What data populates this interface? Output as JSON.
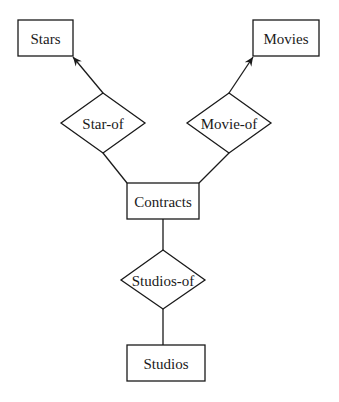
{
  "diagram": {
    "type": "entity-relationship",
    "entities": [
      {
        "id": "stars",
        "label": "Stars"
      },
      {
        "id": "movies",
        "label": "Movies"
      },
      {
        "id": "contracts",
        "label": "Contracts"
      },
      {
        "id": "studios",
        "label": "Studios"
      }
    ],
    "relationships": [
      {
        "id": "star-of",
        "label": "Star-of"
      },
      {
        "id": "movie-of",
        "label": "Movie-of"
      },
      {
        "id": "studios-of",
        "label": "Studios-of"
      }
    ],
    "edges": [
      {
        "from": "star-of",
        "to": "stars",
        "arrow": true
      },
      {
        "from": "contracts",
        "to": "star-of",
        "arrow": false
      },
      {
        "from": "movie-of",
        "to": "movies",
        "arrow": true
      },
      {
        "from": "contracts",
        "to": "movie-of",
        "arrow": false
      },
      {
        "from": "contracts",
        "to": "studios-of",
        "arrow": false
      },
      {
        "from": "studios-of",
        "to": "studios",
        "arrow": false
      }
    ]
  }
}
